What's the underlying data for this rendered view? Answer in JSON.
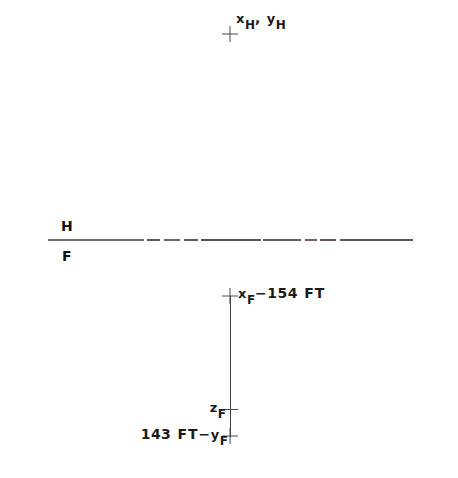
{
  "figure": {
    "type": "engineering-schematic",
    "background_color": "#ffffff",
    "ink_color": "#1a1a1a",
    "line_color": "#4a4a4a",
    "width": 458,
    "height": 478
  },
  "reference_line": {
    "name": "horizontal-reference-line",
    "above_label": "H",
    "below_label": "F",
    "x_start": 48,
    "x_end": 413,
    "y": 240
  },
  "markers": {
    "helicopter_point": {
      "label_var_x": "x",
      "label_sub_x": "H",
      "label_comma": ",",
      "label_var_y": "y",
      "label_sub_y": "H",
      "full_text": "x_H , y_H",
      "cross_x": 230,
      "cross_y": 34
    },
    "top_datum": {
      "label_var": "x",
      "label_sub": "F",
      "label_op": "−",
      "label_num": "154",
      "label_unit": "FT",
      "full_text": "x_F - 154 FT",
      "cross_x": 230,
      "cross_y": 296
    },
    "mid_datum": {
      "label_var": "z",
      "label_sub": "F",
      "full_text": "z_F",
      "tick_y": 409
    },
    "bottom_datum": {
      "label_num": "143",
      "label_unit": "FT",
      "label_op": "−",
      "label_var": "y",
      "label_sub": "F",
      "full_text": "143 FT - y_F",
      "cross_x": 230,
      "cross_y": 436
    }
  },
  "vertical_line": {
    "name": "vertical-datum-line",
    "x": 230,
    "y_top": 296,
    "y_bottom": 436
  },
  "line_segments": [
    {
      "left": 48,
      "width": 96,
      "color": "#6f6f6f"
    },
    {
      "left": 147,
      "width": 13,
      "color": "#5d5d5d"
    },
    {
      "left": 164,
      "width": 16,
      "color": "#6a6a6a"
    },
    {
      "left": 184,
      "width": 14,
      "color": "#5f5f5f"
    },
    {
      "left": 201,
      "width": 60,
      "color": "#555555"
    },
    {
      "left": 263,
      "width": 38,
      "color": "#606060"
    },
    {
      "left": 305,
      "width": 12,
      "color": "#7a5f62"
    },
    {
      "left": 320,
      "width": 16,
      "color": "#6b5456"
    },
    {
      "left": 340,
      "width": 73,
      "color": "#585858"
    }
  ]
}
